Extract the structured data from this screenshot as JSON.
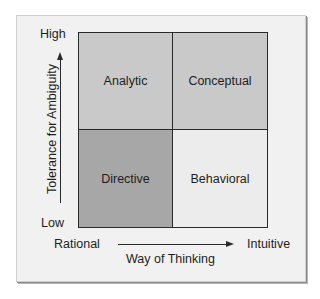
{
  "diagram": {
    "type": "2x2 matrix",
    "y_axis": {
      "label": "Tolerance for Ambiguity",
      "high": "High",
      "low": "Low"
    },
    "x_axis": {
      "label": "Way of Thinking",
      "left": "Rational",
      "right": "Intuitive"
    },
    "quadrants": [
      {
        "position": "top-left",
        "label": "Analytic",
        "color": "#c9c9c9"
      },
      {
        "position": "top-right",
        "label": "Conceptual",
        "color": "#c9c9c9"
      },
      {
        "position": "bottom-left",
        "label": "Directive",
        "color": "#a7a7a7"
      },
      {
        "position": "bottom-right",
        "label": "Behavioral",
        "color": "#ececec"
      }
    ],
    "colors": {
      "background": "#f1f1f1",
      "lines": "#2a2a2a"
    }
  }
}
